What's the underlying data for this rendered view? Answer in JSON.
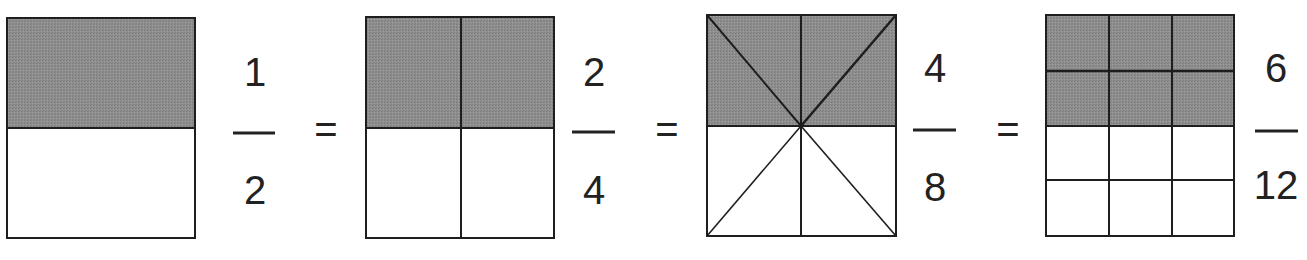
{
  "colors": {
    "shade": "#8c8c8c",
    "line": "#1e1e1e",
    "background": "#ffffff",
    "text": "#222222"
  },
  "equals_sign": "=",
  "figures": [
    {
      "id": "half",
      "numerator": "1",
      "denominator": "2",
      "partition": "horizontal-halves",
      "shaded_parts": 1,
      "total_parts": 2
    },
    {
      "id": "quarters",
      "numerator": "2",
      "denominator": "4",
      "partition": "2x2-grid",
      "shaded_parts": 2,
      "total_parts": 4
    },
    {
      "id": "eighths",
      "numerator": "4",
      "denominator": "8",
      "partition": "triangles-from-center",
      "shaded_parts": 4,
      "total_parts": 8
    },
    {
      "id": "twelfths",
      "numerator": "6",
      "denominator": "12",
      "partition": "3x4-grid",
      "shaded_parts": 6,
      "total_parts": 12
    }
  ]
}
